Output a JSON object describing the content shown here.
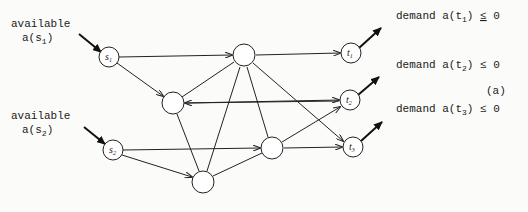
{
  "figure_label": "(a)",
  "sources": [
    {
      "id": "s1",
      "label": "s",
      "sub": "1",
      "caption_line1": "available",
      "caption_line2": "a(s",
      "caption_sub": "1",
      "caption_close": ")"
    },
    {
      "id": "s2",
      "label": "s",
      "sub": "2",
      "caption_line1": "available",
      "caption_line2": "a(s",
      "caption_sub": "2",
      "caption_close": ")"
    }
  ],
  "sinks": [
    {
      "id": "t1",
      "label": "t",
      "sub": "1",
      "caption_pre": "demand a(t",
      "caption_sub": "1",
      "caption_post": ")",
      "caption_rel": "≤",
      "caption_val": "0"
    },
    {
      "id": "t2",
      "label": "t",
      "sub": "2",
      "caption_pre": "demand a(t",
      "caption_sub": "2",
      "caption_post": ")",
      "caption_rel": "≤",
      "caption_val": "0"
    },
    {
      "id": "t3",
      "label": "t",
      "sub": "3",
      "caption_pre": "demand a(t",
      "caption_sub": "3",
      "caption_post": ")",
      "caption_rel": "≤",
      "caption_val": "0"
    }
  ],
  "intermediate_nodes": [
    "A",
    "B",
    "C",
    "D"
  ],
  "edges": [
    [
      "s1",
      "A"
    ],
    [
      "s1",
      "B"
    ],
    [
      "A",
      "B"
    ],
    [
      "t2",
      "B"
    ],
    [
      "B",
      "t2"
    ],
    [
      "A",
      "t1"
    ],
    [
      "A",
      "t3"
    ],
    [
      "A",
      "D"
    ],
    [
      "A",
      "C"
    ],
    [
      "B",
      "C"
    ],
    [
      "s2",
      "D"
    ],
    [
      "s2",
      "C"
    ],
    [
      "C",
      "D"
    ],
    [
      "D",
      "t2"
    ],
    [
      "D",
      "t3"
    ]
  ]
}
